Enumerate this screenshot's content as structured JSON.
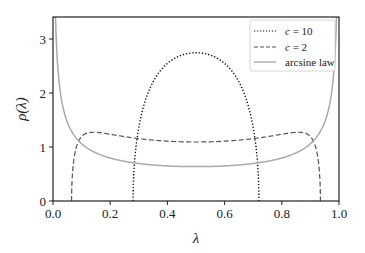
{
  "chart_data": {
    "type": "line",
    "title": "",
    "xlabel": "λ",
    "ylabel": "ρ(λ)",
    "xlim": [
      0.0,
      1.0
    ],
    "ylim": [
      0,
      3.3
    ],
    "xticks": [
      "0.0",
      "0.2",
      "0.4",
      "0.6",
      "0.8",
      "1.0"
    ],
    "yticks": [
      "0",
      "1",
      "2",
      "3"
    ],
    "grid": false,
    "legend_position": "upper right",
    "series": [
      {
        "name": "c = 10",
        "style": "dotted",
        "color": "#111111",
        "support": [
          0.28,
          0.72
        ],
        "peak": 2.75,
        "x": [
          0.28,
          0.3,
          0.35,
          0.4,
          0.45,
          0.5,
          0.55,
          0.6,
          0.65,
          0.7,
          0.72
        ],
        "y": [
          0.0,
          1.15,
          2.05,
          2.5,
          2.7,
          2.75,
          2.7,
          2.5,
          2.05,
          1.15,
          0.0
        ]
      },
      {
        "name": "c = 2",
        "style": "dashed",
        "color": "#555555",
        "support": [
          0.065,
          0.935
        ],
        "x": [
          0.065,
          0.1,
          0.15,
          0.2,
          0.3,
          0.4,
          0.5,
          0.6,
          0.7,
          0.8,
          0.85,
          0.9,
          0.935
        ],
        "y": [
          0.0,
          1.05,
          1.25,
          1.25,
          1.2,
          1.17,
          1.16,
          1.17,
          1.2,
          1.25,
          1.25,
          1.05,
          0.0
        ]
      },
      {
        "name": "arcsine law",
        "style": "solid",
        "color": "#aaaaaa",
        "x": [
          0.01,
          0.05,
          0.1,
          0.2,
          0.3,
          0.4,
          0.5,
          0.6,
          0.7,
          0.8,
          0.9,
          0.95,
          0.99
        ],
        "y": [
          3.2,
          1.46,
          1.06,
          0.8,
          0.69,
          0.65,
          0.64,
          0.65,
          0.69,
          0.8,
          1.06,
          1.46,
          3.2
        ]
      }
    ]
  },
  "legend": {
    "items": [
      {
        "label_var": "c",
        "label_rest": " = 10"
      },
      {
        "label_var": "c",
        "label_rest": " = 2"
      },
      {
        "label_var": "",
        "label_rest": "arcsine law"
      }
    ]
  }
}
